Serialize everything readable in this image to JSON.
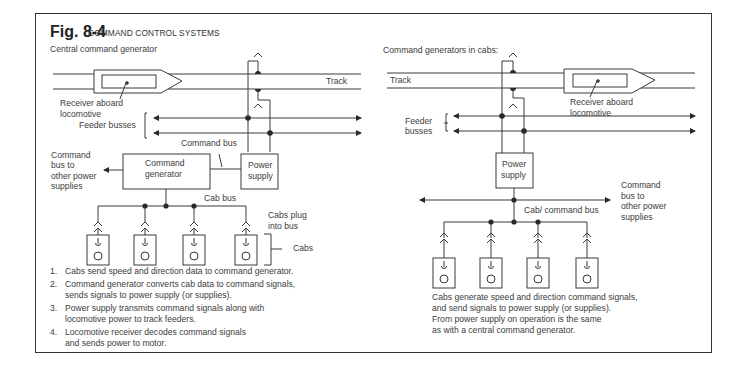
{
  "figure": {
    "number": "Fig. 8-4",
    "title": "COMMAND CONTROL SYSTEMS"
  },
  "left_panel": {
    "heading": "Central command generator",
    "labels": {
      "track": "Track",
      "receiver_line1": "Receiver aboard",
      "receiver_line2": "locomotive",
      "feeder_busses": "Feeder busses",
      "command_bus": "Command bus",
      "command_generator_line1": "Command",
      "command_generator_line2": "generator",
      "power_supply_line1": "Power",
      "power_supply_line2": "supply",
      "other_supplies_line1": "Command",
      "other_supplies_line2": "bus to",
      "other_supplies_line3": "other power",
      "other_supplies_line4": "supplies",
      "cab_bus": "Cab bus",
      "cabs_plug_line1": "Cabs plug",
      "cabs_plug_line2": "into bus",
      "cabs": "Cabs"
    },
    "cab_count": 4,
    "steps": [
      {
        "num": "1.",
        "lines": [
          "Cabs send speed and direction data to command generator."
        ]
      },
      {
        "num": "2.",
        "lines": [
          "Command generator converts cab data to command signals,",
          "sends signals to power supply (or supplies)."
        ]
      },
      {
        "num": "3.",
        "lines": [
          "Power supply transmits command signals along with",
          "locomotive power to track feeders."
        ]
      },
      {
        "num": "4.",
        "lines": [
          "Locomotive receiver decodes command signals",
          "and sends power to motor."
        ]
      }
    ]
  },
  "right_panel": {
    "heading": "Command generators in cabs:",
    "labels": {
      "track": "Track",
      "receiver_line1": "Receiver aboard",
      "receiver_line2": "locomotive",
      "feeder_line1": "Feeder",
      "feeder_line2": "busses",
      "power_supply_line1": "Power",
      "power_supply_line2": "supply",
      "other_supplies_line1": "Command",
      "other_supplies_line2": "bus to",
      "other_supplies_line3": "other power",
      "other_supplies_line4": "supplies",
      "cab_command_bus": "Cab/ command bus"
    },
    "cab_count": 4,
    "caption": [
      "Cabs generate speed and direction command signals,",
      "and send signals to power supply (or supplies).",
      "From power supply on operation is the same",
      "as with a central command generator."
    ]
  },
  "colors": {
    "line": "#3a3a3a",
    "text": "#3c3c3c",
    "frame": "#333333",
    "background": "#ffffff"
  }
}
